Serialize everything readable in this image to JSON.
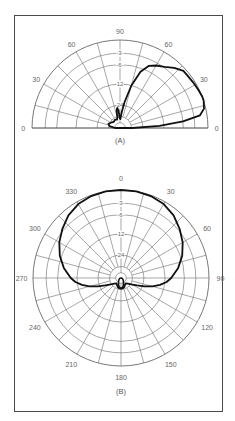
{
  "chart_data": [
    {
      "type": "polar",
      "subtype": "elevation",
      "label": "(A)",
      "angle_range_deg": [
        0,
        180
      ],
      "angle_tick_labels": [
        {
          "angle": 0,
          "text": "0"
        },
        {
          "angle": 30,
          "text": "30"
        },
        {
          "angle": 60,
          "text": "60"
        },
        {
          "angle": 90,
          "text": "90"
        },
        {
          "angle": 120,
          "text": "60"
        },
        {
          "angle": 150,
          "text": "30"
        },
        {
          "angle": 180,
          "text": "0"
        }
      ],
      "ring_labels_db": [
        "3",
        "6",
        "12",
        "24"
      ],
      "radial_scale": "dB (log), outer ring = 0 dB",
      "ring_fractions": [
        1.0,
        0.85,
        0.72,
        0.5,
        0.26,
        0.13,
        0.06
      ],
      "ring_label_fractions": [
        0.85,
        0.72,
        0.5,
        0.26
      ],
      "grid_step_deg": 15,
      "series": [
        {
          "name": "elevation pattern",
          "points": [
            [
              0,
              0.14
            ],
            [
              3,
              0.45
            ],
            [
              6,
              0.72
            ],
            [
              9,
              0.92
            ],
            [
              13,
              0.98
            ],
            [
              18,
              1.0
            ],
            [
              21,
              1.0
            ],
            [
              26,
              0.99
            ],
            [
              32,
              0.98
            ],
            [
              38,
              0.97
            ],
            [
              42,
              0.97
            ],
            [
              48,
              0.92
            ],
            [
              54,
              0.86
            ],
            [
              60,
              0.82
            ],
            [
              65,
              0.78
            ],
            [
              70,
              0.68
            ],
            [
              75,
              0.5
            ],
            [
              80,
              0.3
            ],
            [
              84,
              0.18
            ],
            [
              88,
              0.1
            ],
            [
              92,
              0.12
            ],
            [
              95,
              0.2
            ],
            [
              98,
              0.23
            ],
            [
              101,
              0.2
            ],
            [
              104,
              0.12
            ],
            [
              110,
              0.1
            ],
            [
              120,
              0.11
            ],
            [
              135,
              0.1
            ],
            [
              150,
              0.12
            ],
            [
              160,
              0.14
            ],
            [
              170,
              0.12
            ],
            [
              176,
              0.07
            ],
            [
              180,
              0.05
            ]
          ]
        }
      ]
    },
    {
      "type": "polar",
      "subtype": "azimuth",
      "label": "(B)",
      "angle_range_deg": [
        0,
        360
      ],
      "angle_tick_labels": [
        {
          "angle": 0,
          "text": "0"
        },
        {
          "angle": 30,
          "text": "30"
        },
        {
          "angle": 60,
          "text": "60"
        },
        {
          "angle": 90,
          "text": "90"
        },
        {
          "angle": 120,
          "text": "120"
        },
        {
          "angle": 150,
          "text": "150"
        },
        {
          "angle": 180,
          "text": "180"
        },
        {
          "angle": 210,
          "text": "210"
        },
        {
          "angle": 240,
          "text": "240"
        },
        {
          "angle": 270,
          "text": "270"
        },
        {
          "angle": 300,
          "text": "300"
        },
        {
          "angle": 330,
          "text": "330"
        }
      ],
      "ring_labels_db": [
        "3",
        "6",
        "12",
        "24"
      ],
      "radial_scale": "dB (log), outer ring = 0 dB",
      "ring_fractions": [
        1.0,
        0.85,
        0.72,
        0.5,
        0.26,
        0.13,
        0.06
      ],
      "ring_label_fractions": [
        0.85,
        0.72,
        0.5,
        0.26
      ],
      "grid_step_deg": 15,
      "series": [
        {
          "name": "azimuth pattern",
          "points": [
            [
              0,
              1.0
            ],
            [
              10,
              1.0
            ],
            [
              20,
              0.99
            ],
            [
              30,
              0.97
            ],
            [
              40,
              0.93
            ],
            [
              50,
              0.87
            ],
            [
              60,
              0.81
            ],
            [
              70,
              0.74
            ],
            [
              80,
              0.66
            ],
            [
              90,
              0.57
            ],
            [
              95,
              0.52
            ],
            [
              100,
              0.45
            ],
            [
              105,
              0.37
            ],
            [
              110,
              0.28
            ],
            [
              115,
              0.2
            ],
            [
              120,
              0.15
            ],
            [
              130,
              0.1
            ],
            [
              140,
              0.08
            ],
            [
              150,
              0.09
            ],
            [
              160,
              0.11
            ],
            [
              170,
              0.12
            ],
            [
              180,
              0.12
            ],
            [
              190,
              0.12
            ],
            [
              200,
              0.11
            ],
            [
              210,
              0.09
            ],
            [
              220,
              0.08
            ],
            [
              230,
              0.1
            ],
            [
              240,
              0.15
            ],
            [
              245,
              0.2
            ],
            [
              250,
              0.28
            ],
            [
              255,
              0.37
            ],
            [
              260,
              0.45
            ],
            [
              265,
              0.52
            ],
            [
              270,
              0.57
            ],
            [
              280,
              0.66
            ],
            [
              290,
              0.74
            ],
            [
              300,
              0.81
            ],
            [
              310,
              0.87
            ],
            [
              320,
              0.93
            ],
            [
              330,
              0.97
            ],
            [
              340,
              0.99
            ],
            [
              350,
              1.0
            ],
            [
              360,
              1.0
            ]
          ]
        }
      ]
    }
  ]
}
